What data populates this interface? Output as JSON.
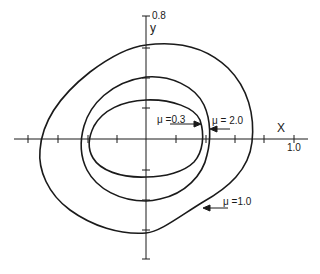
{
  "diagram": {
    "axes": {
      "x_label": "X",
      "y_label": "y",
      "x_max_label": "1.0",
      "y_max_label": "0.8",
      "tick_spacing": 0.2
    },
    "curves": [
      {
        "id": "inner",
        "label": "μ =0.3",
        "mu": 0.3
      },
      {
        "id": "middle",
        "label": "μ = 2.0",
        "mu": 2.0
      },
      {
        "id": "outer",
        "label": "μ =1.0",
        "mu": 1.0
      }
    ],
    "colors": {
      "line": "#1a1a1a",
      "background": "#ffffff"
    }
  }
}
